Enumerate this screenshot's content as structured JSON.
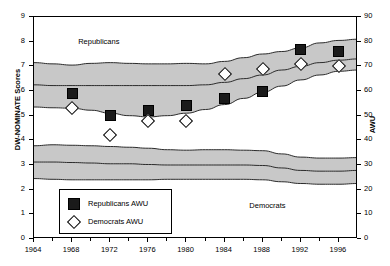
{
  "chart_data": {
    "type": "area",
    "title": "",
    "xlabel": "",
    "ylabel": "DW-NOMINATE Scores",
    "y2label": "AWU",
    "xlim": [
      1964,
      1998
    ],
    "ylim": [
      0,
      9
    ],
    "y2lim": [
      0,
      90
    ],
    "grid": false,
    "legend_position": "lower-left-inside",
    "x_tick_labels": [
      "1964",
      "1968",
      "1972",
      "1976",
      "1980",
      "1984",
      "1988",
      "1992",
      "1996"
    ],
    "x_tick_values": [
      1964,
      1968,
      1972,
      1976,
      1980,
      1984,
      1988,
      1992,
      1996
    ],
    "y_tick_labels": [
      "0",
      "1",
      "2",
      "3",
      "4",
      "5",
      "6",
      "7",
      "8",
      "9"
    ],
    "y_tick_values": [
      0,
      1,
      2,
      3,
      4,
      5,
      6,
      7,
      8,
      9
    ],
    "y2_tick_labels": [
      "0",
      "10",
      "20",
      "30",
      "40",
      "50",
      "60",
      "70",
      "80",
      "90"
    ],
    "y2_tick_values": [
      0,
      10,
      20,
      30,
      40,
      50,
      60,
      70,
      80,
      90
    ],
    "annotations": [
      {
        "text": "Republicans",
        "x": 1970.8,
        "y": 8.0
      },
      {
        "text": "Democrats",
        "x": 1988.5,
        "y": 1.35
      }
    ],
    "bands": [
      {
        "name": "Republicans DW-NOMINATE band",
        "fill": "#c8c8c8",
        "x": [
          1964,
          1966,
          1968,
          1970,
          1972,
          1974,
          1976,
          1978,
          1980,
          1982,
          1984,
          1986,
          1988,
          1990,
          1992,
          1994,
          1996,
          1998
        ],
        "upper": [
          7.15,
          7.1,
          7.05,
          7.12,
          7.15,
          7.12,
          7.1,
          7.1,
          7.12,
          7.1,
          7.2,
          7.35,
          7.5,
          7.6,
          7.75,
          7.95,
          8.05,
          8.1
        ],
        "lower": [
          5.35,
          5.32,
          5.3,
          5.22,
          5.1,
          5.0,
          4.95,
          5.0,
          5.1,
          5.25,
          5.45,
          5.7,
          5.95,
          6.2,
          6.45,
          6.65,
          6.8,
          6.85
        ]
      },
      {
        "name": "Democrats DW-NOMINATE band",
        "fill": "#c8c8c8",
        "x": [
          1964,
          1966,
          1968,
          1970,
          1972,
          1974,
          1976,
          1978,
          1980,
          1982,
          1984,
          1986,
          1988,
          1990,
          1992,
          1994,
          1996,
          1998
        ],
        "upper": [
          3.78,
          3.82,
          3.8,
          3.78,
          3.75,
          3.72,
          3.68,
          3.62,
          3.6,
          3.62,
          3.62,
          3.6,
          3.58,
          3.45,
          3.32,
          3.28,
          3.28,
          3.3
        ],
        "lower": [
          2.45,
          2.42,
          2.4,
          2.4,
          2.4,
          2.4,
          2.4,
          2.42,
          2.42,
          2.42,
          2.42,
          2.42,
          2.4,
          2.32,
          2.25,
          2.22,
          2.22,
          2.25
        ]
      }
    ],
    "median_lines": [
      {
        "name": "Republicans median",
        "x": [
          1964,
          1966,
          1968,
          1970,
          1972,
          1974,
          1976,
          1978,
          1980,
          1982,
          1984,
          1986,
          1988,
          1990,
          1992,
          1994,
          1996,
          1998
        ],
        "y": [
          6.25,
          6.22,
          6.22,
          6.22,
          6.22,
          6.22,
          6.22,
          6.22,
          6.22,
          6.25,
          6.35,
          6.5,
          6.65,
          6.85,
          7.0,
          7.15,
          7.25,
          7.3
        ]
      },
      {
        "name": "Democrats median",
        "x": [
          1964,
          1966,
          1968,
          1970,
          1972,
          1974,
          1976,
          1978,
          1980,
          1982,
          1984,
          1986,
          1988,
          1990,
          1992,
          1994,
          1996,
          1998
        ],
        "y": [
          3.12,
          3.12,
          3.1,
          3.08,
          3.05,
          3.05,
          3.02,
          3.0,
          3.0,
          3.0,
          3.0,
          3.0,
          2.98,
          2.88,
          2.78,
          2.75,
          2.75,
          2.78
        ]
      }
    ],
    "series": [
      {
        "name": "Republicans AWU",
        "marker": "filled-square",
        "color": "#1a1a1a",
        "axis": "right",
        "x": [
          1968,
          1972,
          1976,
          1980,
          1984,
          1988,
          1992,
          1996
        ],
        "values": [
          59,
          50,
          52,
          54,
          57,
          60,
          77,
          76
        ]
      },
      {
        "name": "Democrats AWU",
        "marker": "open-diamond",
        "color": "#ffffff",
        "axis": "right",
        "x": [
          1968,
          1972,
          1976,
          1980,
          1984,
          1988,
          1992,
          1996
        ],
        "values": [
          53,
          42,
          48,
          48,
          67,
          69,
          71,
          70
        ]
      }
    ]
  },
  "legend": {
    "items": [
      {
        "label": "Republicans AWU",
        "marker": "filled-square"
      },
      {
        "label": "Democrats AWU",
        "marker": "open-diamond"
      }
    ]
  }
}
